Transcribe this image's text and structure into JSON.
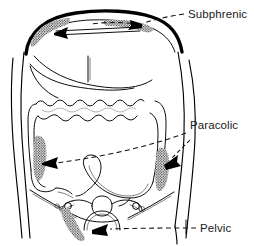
{
  "figure": {
    "background_color": "#ffffff",
    "line_color": "#000000",
    "text_color": "#1a1a1a",
    "stipple_color": "#111111"
  },
  "labels": [
    {
      "id": "subphrenic",
      "text": "Subphrenic",
      "x": 188,
      "y": 17,
      "leader_style": "dashed",
      "arrow_count": 2,
      "targets": [
        "left-subphrenic-space",
        "right-subphrenic-space"
      ]
    },
    {
      "id": "paracolic",
      "text": "Paracolic",
      "x": 190,
      "y": 128,
      "leader_style": "dashed",
      "arrow_count": 2,
      "targets": [
        "left-paracolic-gutter",
        "right-paracolic-gutter"
      ]
    },
    {
      "id": "pelvic",
      "text": "Pelvic",
      "x": 200,
      "y": 231,
      "leader_style": "dashed",
      "arrow_count": 1,
      "targets": [
        "pelvic-recess"
      ]
    }
  ],
  "stippled_regions": [
    {
      "id": "left-subphrenic-space",
      "name": "left subphrenic space",
      "label_ref": "subphrenic",
      "center_x": 44,
      "center_y": 28
    },
    {
      "id": "right-subphrenic-space",
      "name": "right subphrenic space",
      "label_ref": "subphrenic",
      "center_x": 129,
      "center_y": 24
    },
    {
      "id": "left-paracolic-gutter",
      "name": "left paracolic gutter",
      "label_ref": "paracolic",
      "center_x": 42,
      "center_y": 155
    },
    {
      "id": "right-paracolic-gutter",
      "name": "right paracolic gutter",
      "label_ref": "paracolic",
      "center_x": 163,
      "center_y": 167
    },
    {
      "id": "pelvic-recess",
      "name": "pelvic recess",
      "label_ref": "pelvic",
      "center_x": 80,
      "center_y": 224
    }
  ],
  "anatomy_parts": [
    {
      "id": "torso-outline",
      "name": "abdominal wall outline"
    },
    {
      "id": "diaphragm",
      "name": "diaphragm"
    },
    {
      "id": "liver",
      "name": "liver"
    },
    {
      "id": "transverse-colon",
      "name": "transverse colon"
    },
    {
      "id": "ascending-colon",
      "name": "ascending colon"
    },
    {
      "id": "descending-colon",
      "name": "descending colon"
    },
    {
      "id": "sigmoid-colon",
      "name": "sigmoid colon"
    },
    {
      "id": "cecum",
      "name": "cecum"
    },
    {
      "id": "uterus",
      "name": "uterus"
    },
    {
      "id": "bladder",
      "name": "bladder"
    },
    {
      "id": "pelvic-brim",
      "name": "pelvic brim"
    }
  ]
}
